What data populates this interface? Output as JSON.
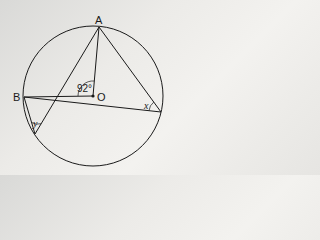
{
  "diagram": {
    "type": "circle-theorem",
    "circle": {
      "center": "O",
      "cx": 93,
      "cy": 96,
      "r": 70
    },
    "points": {
      "A": {
        "label": "A",
        "x": 99,
        "y": 27
      },
      "B": {
        "label": "B",
        "x": 24,
        "y": 97
      },
      "O": {
        "label": "O",
        "x": 93,
        "y": 96
      },
      "C": {
        "label": "",
        "x": 161,
        "y": 112
      },
      "D": {
        "label": "",
        "x": 35,
        "y": 134
      }
    },
    "segments": [
      [
        "A",
        "O"
      ],
      [
        "B",
        "O"
      ],
      [
        "B",
        "C"
      ],
      [
        "A",
        "C"
      ],
      [
        "A",
        "D"
      ],
      [
        "B",
        "D"
      ]
    ],
    "angles": {
      "center": {
        "vertex": "O",
        "label": "92°"
      },
      "x": {
        "vertex": "C",
        "label": "x"
      },
      "y": {
        "vertex": "D",
        "label": "y"
      }
    },
    "colors": {
      "stroke": "#1a1a1a",
      "background": "#ecebe8"
    }
  }
}
